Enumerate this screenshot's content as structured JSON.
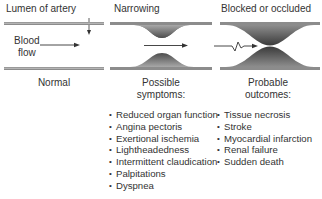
{
  "panels": {
    "normal": {
      "title": "Lumen of artery",
      "flow_label_line1": "Blood",
      "flow_label_line2": "flow",
      "caption": "Normal"
    },
    "narrowing": {
      "title": "Narrowing",
      "caption_line1": "Possible",
      "caption_line2": "symptoms:",
      "items": [
        "Reduced organ function",
        "Angina pectoris",
        "Exertional ischemia",
        "Lightheadedness",
        "Intermittent claudication",
        "Palpitations",
        "Dyspnea"
      ]
    },
    "blocked": {
      "title": "Blocked or occluded",
      "caption_line1": "Probable",
      "caption_line2": "outcomes:",
      "items": [
        "Tissue necrosis",
        "Stroke",
        "Myocardial infarction",
        "Renal failure",
        "Sudden death"
      ]
    }
  },
  "colors": {
    "wall": "#8c8c8c",
    "plaque_dark": "#4a4a4a",
    "plaque_light": "#b5b5b5",
    "text": "#333333"
  }
}
